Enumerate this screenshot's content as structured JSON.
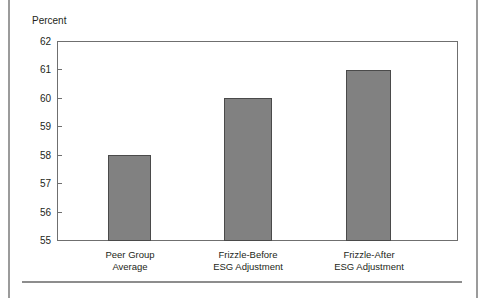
{
  "page": {
    "has_left_margin_rule": true,
    "has_right_margin_rule": true,
    "has_bottom_rule": true
  },
  "chart_data": {
    "type": "bar",
    "title": "",
    "subtitle": "",
    "xlabel": "",
    "ylabel": "Percent",
    "ylim": [
      55,
      62
    ],
    "ytick_labels": [
      "62",
      "61",
      "60",
      "59",
      "58",
      "57",
      "56",
      "55"
    ],
    "yticks": [
      62,
      61,
      60,
      59,
      58,
      57,
      56,
      55
    ],
    "grid": false,
    "legend": false,
    "legend_position": "none",
    "bar_color": "#818181",
    "bar_border_color": "#4a4a4a",
    "axis_color": "#6f6f6f",
    "categories": [
      "Peer Group Average",
      "Frizzle-Before ESG Adjustment",
      "Frizzle-After ESG Adjustment"
    ],
    "category_lines": [
      [
        "Peer Group",
        "Average"
      ],
      [
        "Frizzle-Before",
        "ESG Adjustment"
      ],
      [
        "Frizzle-After",
        "ESG Adjustment"
      ]
    ],
    "values": [
      58,
      60,
      61
    ]
  }
}
